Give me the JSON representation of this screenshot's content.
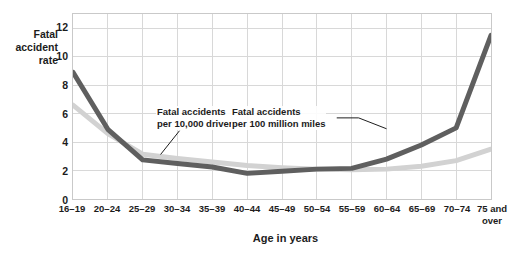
{
  "chart_data": {
    "type": "line",
    "title": "",
    "xlabel": "Age in years",
    "ylabel": "Fatal\naccident\nrate",
    "grid": true,
    "legend_position": "inline-annotations",
    "categories": [
      "16–19",
      "20–24",
      "25–29",
      "30–34",
      "35–39",
      "40–44",
      "45–49",
      "50–54",
      "55–59",
      "60–64",
      "65–69",
      "70–74",
      "75 and\nover"
    ],
    "xtick_labels": [
      "16–19",
      "20–24",
      "25–29",
      "30–34",
      "35–39",
      "40–44",
      "45–49",
      "50–54",
      "55–59",
      "60–64",
      "65–69",
      "70–74",
      "75 and\nover"
    ],
    "ytick_labels": [
      "0",
      "2",
      "4",
      "6",
      "8",
      "10",
      "12"
    ],
    "ytick_values": [
      0,
      2,
      4,
      6,
      8,
      10,
      12
    ],
    "ylim": [
      0,
      13
    ],
    "xlim": [
      0,
      12
    ],
    "series": [
      {
        "name": "Fatal accidents per 100 million miles",
        "color": "#5f5f5f",
        "values": [
          8.9,
          4.9,
          2.75,
          2.5,
          2.25,
          1.8,
          1.95,
          2.1,
          2.15,
          2.8,
          3.8,
          5.0,
          11.5
        ]
      },
      {
        "name": "Fatal accidents per 10,000 drivers",
        "color": "#d2d2d2",
        "values": [
          6.6,
          4.6,
          3.15,
          2.85,
          2.6,
          2.35,
          2.2,
          2.1,
          2.05,
          2.1,
          2.3,
          2.7,
          3.5
        ]
      }
    ],
    "annotations": [
      {
        "name": "annotation-drivers",
        "text": "Fatal accidents\nper 10,000 drivers",
        "series": "Fatal accidents per 10,000 drivers",
        "points_to_category": "25–29"
      },
      {
        "name": "annotation-miles",
        "text": "Fatal accidents\nper 100 million miles",
        "series": "Fatal accidents per 100 million miles",
        "points_to_category": "70–74"
      }
    ],
    "colors": {
      "miles_line": "#5f5f5f",
      "drivers_line": "#d2d2d2",
      "grid": "#d8d8d8",
      "frame": "#c9c9c9",
      "text": "#1c1c1c",
      "background": "#ffffff"
    }
  }
}
